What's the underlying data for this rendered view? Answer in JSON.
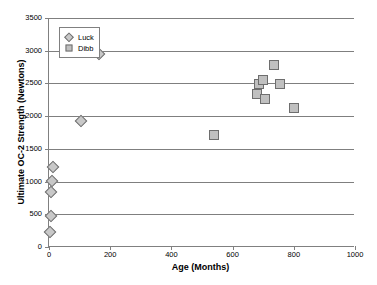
{
  "chart_data": {
    "type": "scatter",
    "title": "",
    "xlabel": "Age (Months)",
    "ylabel": "Ultimate OC-2 Strength (Newtons)",
    "xlim": [
      0,
      1000
    ],
    "ylim": [
      0,
      3500
    ],
    "xticks": [
      0,
      200,
      400,
      600,
      800,
      1000
    ],
    "yticks": [
      0,
      500,
      1000,
      1500,
      2000,
      2500,
      3000,
      3500
    ],
    "grid": "horizontal",
    "legend_position": "upper-left-inside",
    "series": [
      {
        "name": "Luck",
        "marker": "diamond",
        "color": "#c8c8c8",
        "edge_color": "#6e6e6e",
        "points": [
          {
            "x": 2,
            "y": 235
          },
          {
            "x": 5,
            "y": 470
          },
          {
            "x": 8,
            "y": 840
          },
          {
            "x": 10,
            "y": 1015
          },
          {
            "x": 14,
            "y": 1230
          },
          {
            "x": 105,
            "y": 1920
          },
          {
            "x": 165,
            "y": 2955
          }
        ]
      },
      {
        "name": "Dibb",
        "marker": "square",
        "color": "#c0c0c0",
        "edge_color": "#6e6e6e",
        "points": [
          {
            "x": 540,
            "y": 1710
          },
          {
            "x": 680,
            "y": 2335
          },
          {
            "x": 685,
            "y": 2495
          },
          {
            "x": 700,
            "y": 2555
          },
          {
            "x": 705,
            "y": 2255
          },
          {
            "x": 735,
            "y": 2775
          },
          {
            "x": 755,
            "y": 2495
          },
          {
            "x": 800,
            "y": 2130
          }
        ]
      }
    ]
  },
  "axes": {
    "x": {
      "title": "Age (Months)",
      "tick_labels": [
        "0",
        "200",
        "400",
        "600",
        "800",
        "1000"
      ]
    },
    "y": {
      "title": "Ultimate OC-2 Strength (Newtons)",
      "tick_labels": [
        "0",
        "500",
        "1000",
        "1500",
        "2000",
        "2500",
        "3000",
        "3500"
      ]
    }
  },
  "legend": {
    "entries": [
      {
        "label": "Luck",
        "marker": "diamond"
      },
      {
        "label": "Dibb",
        "marker": "square"
      }
    ]
  }
}
